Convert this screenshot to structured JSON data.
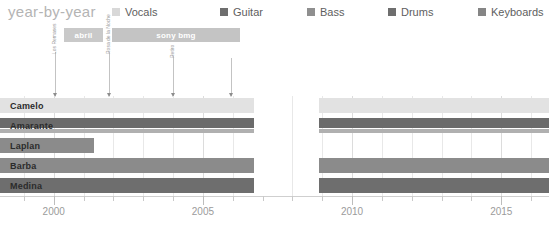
{
  "header": {
    "title": "year-by-year",
    "legend": [
      {
        "label": "Vocals",
        "color": "#d8d8d8"
      },
      {
        "label": "Guitar",
        "color": "#6e6e6e"
      },
      {
        "label": "Bass",
        "color": "#8f8f8f"
      },
      {
        "label": "Drums",
        "color": "#6e6e6e"
      },
      {
        "label": "Keyboards",
        "color": "#858585"
      }
    ]
  },
  "eras": [
    {
      "label": "abril",
      "start": 2000.35,
      "end": 2001.65,
      "color": "#c9c9c9"
    },
    {
      "label": "sony bmg",
      "start": 2001.95,
      "end": 2006.25,
      "color": "#c4c4c4"
    }
  ],
  "events": [
    {
      "label": "Los Remases",
      "year": 2000.05,
      "height": 44
    },
    {
      "label": "Rosa de la Noche",
      "year": 2001.85,
      "height": 44
    },
    {
      "label": "Retiro",
      "year": 2004.0,
      "height": 40
    },
    {
      "label": "",
      "year": 2005.95,
      "height": 38
    }
  ],
  "chart_data": {
    "type": "bar",
    "title": "year-by-year",
    "xlabel": "",
    "ylabel": "",
    "xlim": [
      1998.2,
      2016.6
    ],
    "grid": true,
    "legend_position": "top",
    "axis_ticks": [
      2000,
      2005,
      2010,
      2015
    ],
    "minor_tick_step": 1,
    "gap_zone": {
      "start": 2006.7,
      "end": 2008.9,
      "stripes": 8
    },
    "categories": [
      "Camelo",
      "Amarante",
      "Laplan",
      "Barba",
      "Medina"
    ],
    "series": [
      {
        "name": "Camelo",
        "role": "Vocals",
        "color": "#e2e2e2",
        "spans": [
          {
            "start": 1998.2,
            "end": 2006.7
          },
          {
            "start": 2008.9,
            "end": 2016.6
          }
        ]
      },
      {
        "name": "Amarante",
        "role": "Guitar",
        "color": "#6b6b6b",
        "spans": [
          {
            "start": 1998.2,
            "end": 2006.7
          },
          {
            "start": 2008.9,
            "end": 2016.6
          }
        ],
        "secondary": {
          "role": "Keyboards",
          "color": "#b0b0b0",
          "spans": [
            {
              "start": 1998.2,
              "end": 2006.7
            },
            {
              "start": 2008.9,
              "end": 2016.6
            }
          ]
        }
      },
      {
        "name": "Laplan",
        "role": "Bass",
        "color": "#8b8b8b",
        "spans": [
          {
            "start": 1998.2,
            "end": 2001.35
          }
        ]
      },
      {
        "name": "Barba",
        "role": "Bass",
        "color": "#8b8b8b",
        "spans": [
          {
            "start": 1998.2,
            "end": 2006.7
          },
          {
            "start": 2008.9,
            "end": 2016.6
          }
        ]
      },
      {
        "name": "Medina",
        "role": "Drums",
        "color": "#6e6e6e",
        "hatch": true,
        "spans": [
          {
            "start": 1998.2,
            "end": 2006.7
          },
          {
            "start": 2008.9,
            "end": 2016.6
          }
        ]
      }
    ]
  }
}
